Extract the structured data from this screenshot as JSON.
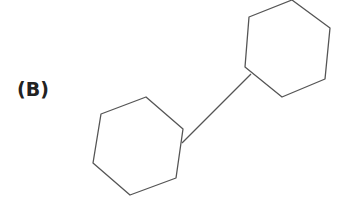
{
  "figure": {
    "label": "(B)",
    "stroke_color": "#555555",
    "rings": [
      {
        "name": "ring-left",
        "points": "101,114 146,97 183,129 176,178 130,195 93,163"
      },
      {
        "name": "ring-right",
        "points": "249,17 292,0 330,28 325,79 282,97 245,67"
      }
    ],
    "bond": {
      "x1": 182,
      "y1": 143,
      "x2": 251,
      "y2": 74
    }
  }
}
